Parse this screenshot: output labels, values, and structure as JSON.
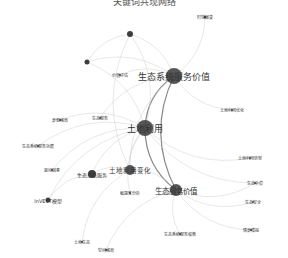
{
  "title": "关键词共现网络",
  "chart_data": {
    "type": "network",
    "nodes": [
      {
        "id": "n1",
        "label": "生态系统服务价值",
        "x": 174,
        "y": 76,
        "r": 8,
        "fs": 9
      },
      {
        "id": "n2",
        "label": "土地利用",
        "x": 145,
        "y": 128,
        "r": 8,
        "fs": 9
      },
      {
        "id": "n3",
        "label": "生态服务价值",
        "x": 176,
        "y": 190,
        "r": 6,
        "fs": 7.5
      },
      {
        "id": "n4",
        "label": "土地利用变化",
        "x": 130,
        "y": 170,
        "r": 5,
        "fs": 6.5
      },
      {
        "id": "n5",
        "label": "生态系统服务",
        "x": 92,
        "y": 174,
        "r": 4,
        "fs": 5
      },
      {
        "id": "n6",
        "label": "InVEST模型",
        "x": 48,
        "y": 200,
        "r": 2.5,
        "fs": 5
      },
      {
        "id": "n7",
        "label": "",
        "x": 130,
        "y": 34,
        "r": 3,
        "fs": 4
      },
      {
        "id": "n8",
        "label": "",
        "x": 87,
        "y": 62,
        "r": 2.5,
        "fs": 4
      },
      {
        "id": "n9",
        "label": "时空演变",
        "x": 205,
        "y": 17,
        "r": 1.5,
        "fs": 4
      },
      {
        "id": "n10",
        "label": "价值评估",
        "x": 120,
        "y": 75,
        "r": 1,
        "fs": 4
      },
      {
        "id": "n11",
        "label": "土地利用优化",
        "x": 232,
        "y": 110,
        "r": 1,
        "fs": 4
      },
      {
        "id": "n12",
        "label": "生态服务",
        "x": 100,
        "y": 118,
        "r": 1,
        "fs": 4
      },
      {
        "id": "n13",
        "label": "景观格局",
        "x": 60,
        "y": 120,
        "r": 1,
        "fs": 4
      },
      {
        "id": "n14",
        "label": "生态系统服务功能",
        "x": 38,
        "y": 146,
        "r": 1,
        "fs": 4
      },
      {
        "id": "n15",
        "label": "驱动因素",
        "x": 52,
        "y": 170,
        "r": 1,
        "fs": 4
      },
      {
        "id": "n16",
        "label": "敏感性分析",
        "x": 130,
        "y": 193,
        "r": 1,
        "fs": 4
      },
      {
        "id": "n17",
        "label": "生态补偿",
        "x": 255,
        "y": 183,
        "r": 1,
        "fs": 4
      },
      {
        "id": "n18",
        "label": "土地利用转型",
        "x": 250,
        "y": 158,
        "r": 1,
        "fs": 4
      },
      {
        "id": "n19",
        "label": "生态安全",
        "x": 253,
        "y": 202,
        "r": 1,
        "fs": 4
      },
      {
        "id": "n20",
        "label": "情景模拟",
        "x": 251,
        "y": 230,
        "r": 1,
        "fs": 4
      },
      {
        "id": "n21",
        "label": "生态系统服务权衡",
        "x": 180,
        "y": 234,
        "r": 1,
        "fs": 4
      },
      {
        "id": "n22",
        "label": "土地生态",
        "x": 82,
        "y": 242,
        "r": 1,
        "fs": 4
      },
      {
        "id": "n23",
        "label": "空间格局",
        "x": 106,
        "y": 250,
        "r": 1,
        "fs": 4
      }
    ],
    "edges": [
      [
        "n1",
        "n2"
      ],
      [
        "n1",
        "n7"
      ],
      [
        "n1",
        "n9"
      ],
      [
        "n1",
        "n3"
      ],
      [
        "n1",
        "n4"
      ],
      [
        "n1",
        "n8"
      ],
      [
        "n1",
        "n11"
      ],
      [
        "n1",
        "n12"
      ],
      [
        "n1",
        "n10"
      ],
      [
        "n2",
        "n7"
      ],
      [
        "n2",
        "n8"
      ],
      [
        "n2",
        "n3"
      ],
      [
        "n2",
        "n4"
      ],
      [
        "n2",
        "n5"
      ],
      [
        "n2",
        "n13"
      ],
      [
        "n2",
        "n14"
      ],
      [
        "n2",
        "n15"
      ],
      [
        "n2",
        "n16"
      ],
      [
        "n2",
        "n18"
      ],
      [
        "n2",
        "n17"
      ],
      [
        "n2",
        "n6"
      ],
      [
        "n3",
        "n4"
      ],
      [
        "n3",
        "n19"
      ],
      [
        "n3",
        "n20"
      ],
      [
        "n3",
        "n21"
      ],
      [
        "n3",
        "n17"
      ],
      [
        "n3",
        "n23"
      ],
      [
        "n4",
        "n5"
      ],
      [
        "n4",
        "n22"
      ],
      [
        "n5",
        "n6"
      ],
      [
        "n7",
        "n8"
      ],
      [
        "n7",
        "n4"
      ]
    ]
  }
}
